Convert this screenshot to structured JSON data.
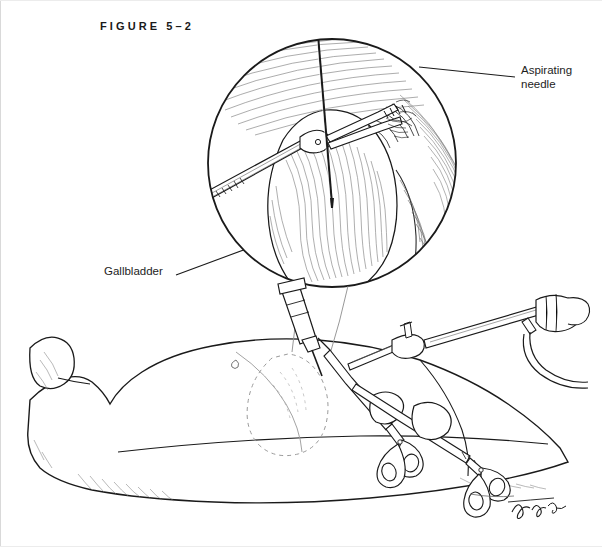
{
  "figure": {
    "caption": "FIGURE 5–2",
    "domain": "medical-illustration",
    "style": "pen-and-ink line drawing",
    "background_color": "#ffffff",
    "ink_color": "#1a1a1a",
    "hatch_color": "#555555"
  },
  "labels": {
    "aspirating_needle": "Aspirating\nneedle",
    "gallbladder": "Gallbladder"
  },
  "inset": {
    "name": "magnified-laparoscopic-view",
    "shape": "circle",
    "center_x": 332,
    "center_y": 163,
    "radius": 124,
    "contents": [
      "gallbladder-fundus",
      "grasping-forceps",
      "aspirating-needle",
      "liver-edge",
      "peritoneal-hatching"
    ]
  },
  "scene": {
    "name": "supine-patient-abdomen",
    "contents": [
      "patient-torso",
      "patient-arm",
      "gallbladder-outline-dashed",
      "aspirating-needle-assembly",
      "trocar-cannula-upper",
      "laparoscope-with-light-cable",
      "grasping-instrument-left",
      "grasping-instrument-right"
    ]
  },
  "signature": {
    "present": true,
    "description": "artist cursive signature",
    "x": 520,
    "y": 508
  }
}
